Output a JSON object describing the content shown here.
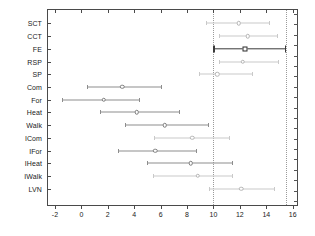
{
  "chart_data": {
    "type": "scatter",
    "title": "",
    "subtitle": "",
    "xlabel": "",
    "ylabel": "",
    "xlim": [
      -2.6,
      16.4
    ],
    "ylim": [
      0,
      15
    ],
    "grid": false,
    "legend": null,
    "orientation": "horizontal-forest-plot",
    "xticks": [
      -2,
      0,
      2,
      4,
      6,
      8,
      10,
      12,
      14,
      16
    ],
    "xticklabels": [
      "-2",
      "0",
      "2",
      "4",
      "6",
      "8",
      "10",
      "12",
      "14",
      "16"
    ],
    "categories": [
      "SCT",
      "CCT",
      "FE",
      "RSP",
      "SP",
      "Com",
      "For",
      "Heat",
      "Walk",
      "ICom",
      "IFor",
      "IHeat",
      "IWalk",
      "LVN"
    ],
    "reference_lines": [
      {
        "x": 10.0,
        "style": "dotted",
        "color": "#9a9a9a"
      },
      {
        "x": 15.5,
        "style": "dotted",
        "color": "#9a9a9a"
      }
    ],
    "points": [
      {
        "category": "SCT",
        "estimate": 11.9,
        "low": 9.4,
        "high": 14.2,
        "marker": "circle",
        "emphasis": "light"
      },
      {
        "category": "CCT",
        "estimate": 12.6,
        "low": 10.4,
        "high": 14.8,
        "marker": "circle",
        "emphasis": "light"
      },
      {
        "category": "FE",
        "estimate": 12.4,
        "low": 10.0,
        "high": 15.4,
        "marker": "square",
        "emphasis": "bold"
      },
      {
        "category": "RSP",
        "estimate": 12.2,
        "low": 10.4,
        "high": 14.9,
        "marker": "circle",
        "emphasis": "light"
      },
      {
        "category": "SP",
        "estimate": 10.3,
        "low": 8.9,
        "high": 12.9,
        "marker": "circle",
        "emphasis": "light"
      },
      {
        "category": "Com",
        "estimate": 3.1,
        "low": 0.4,
        "high": 6.0,
        "marker": "circle",
        "emphasis": "medium"
      },
      {
        "category": "For",
        "estimate": 1.7,
        "low": -1.5,
        "high": 4.4,
        "marker": "circle",
        "emphasis": "medium"
      },
      {
        "category": "Heat",
        "estimate": 4.2,
        "low": 1.4,
        "high": 7.4,
        "marker": "circle",
        "emphasis": "medium"
      },
      {
        "category": "Walk",
        "estimate": 6.3,
        "low": 3.3,
        "high": 9.6,
        "marker": "circle",
        "emphasis": "medium"
      },
      {
        "category": "ICom",
        "estimate": 8.4,
        "low": 5.5,
        "high": 11.2,
        "marker": "circle",
        "emphasis": "light"
      },
      {
        "category": "IFor",
        "estimate": 5.6,
        "low": 2.8,
        "high": 8.7,
        "marker": "circle",
        "emphasis": "medium"
      },
      {
        "category": "IHeat",
        "estimate": 8.3,
        "low": 5.0,
        "high": 11.4,
        "marker": "circle",
        "emphasis": "medium"
      },
      {
        "category": "IWalk",
        "estimate": 8.8,
        "low": 5.4,
        "high": 11.4,
        "marker": "circle",
        "emphasis": "light"
      },
      {
        "category": "LVN",
        "estimate": 12.1,
        "low": 9.7,
        "high": 14.6,
        "marker": "circle",
        "emphasis": "light"
      }
    ]
  },
  "axes": {
    "right_minor_tick_count": 19
  }
}
